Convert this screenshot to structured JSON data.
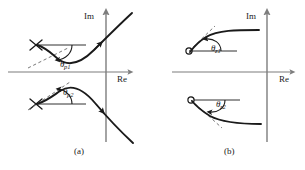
{
  "figure": {
    "background_color": "#ffffff",
    "ink_color": "#1a1a1a",
    "axis_color": "#7d7d7d",
    "locus_color": "#1a1a1a",
    "dashed_color": "#6a6a6a"
  },
  "panels": [
    {
      "id": "a",
      "caption": "(a)",
      "axes": {
        "imaginary_axis_label": "Im",
        "real_axis_label": "Re",
        "origin": {
          "x": 106,
          "y": 72
        }
      },
      "markers": [
        {
          "kind": "pole",
          "glyph": "x-marker",
          "name": "pole-upper",
          "x": 36,
          "y": 45
        },
        {
          "kind": "pole",
          "glyph": "x-marker",
          "name": "pole-lower",
          "x": 36,
          "y": 104
        }
      ],
      "angles": [
        {
          "name": "theta-p1",
          "symbol": "θ",
          "subscript": "p1",
          "label": "θp1",
          "measured_at": "pole-upper",
          "direction": "below-horizontal"
        },
        {
          "name": "theta-p2",
          "symbol": "θ",
          "subscript": "p2",
          "label": "θp2",
          "measured_at": "pole-lower",
          "direction": "above-horizontal"
        }
      ],
      "loci": [
        {
          "name": "locus-upper-branch",
          "description": "Branch departing upper pole downward-right then sweeping up across the Im axis with arrow pointing up-right"
        },
        {
          "name": "locus-lower-branch",
          "description": "Branch departing lower pole upward-right then sweeping down across the Im axis with arrow pointing down-right"
        }
      ]
    },
    {
      "id": "b",
      "caption": "(b)",
      "axes": {
        "imaginary_axis_label": "Im",
        "real_axis_label": "Re",
        "origin": {
          "x": 267,
          "y": 72
        }
      },
      "markers": [
        {
          "kind": "zero",
          "glyph": "o-marker",
          "name": "zero-upper",
          "x": 189,
          "y": 51
        },
        {
          "kind": "zero",
          "glyph": "o-marker",
          "name": "zero-lower",
          "x": 191,
          "y": 100
        }
      ],
      "angles": [
        {
          "name": "theta-z1",
          "symbol": "θ",
          "subscript": "z1",
          "label": "θz1",
          "measured_at": "zero-upper",
          "direction": "above-horizontal"
        },
        {
          "name": "theta-z2",
          "symbol": "θ",
          "subscript": "z2",
          "label": "θz2",
          "measured_at": "zero-lower",
          "direction": "below-horizontal"
        }
      ],
      "loci": [
        {
          "name": "locus-upper-branch",
          "description": "Branch arriving at upper zero from the upper right, flattening out toward the right"
        },
        {
          "name": "locus-lower-branch",
          "description": "Branch arriving at lower zero from the lower right, flattening out toward the right"
        }
      ]
    }
  ]
}
